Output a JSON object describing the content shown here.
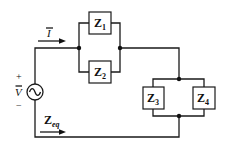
{
  "diagram": {
    "type": "circuit",
    "current_label": "I",
    "source": {
      "label": "V",
      "plus": "+",
      "minus": "−",
      "symbol": "~"
    },
    "equivalent_label": {
      "main": "Z",
      "sub": "eq"
    },
    "impedances": [
      {
        "main": "Z",
        "sub": "1"
      },
      {
        "main": "Z",
        "sub": "2"
      },
      {
        "main": "Z",
        "sub": "3"
      },
      {
        "main": "Z",
        "sub": "4"
      }
    ],
    "topology": "V source in series with (Z1 || Z2) in series with (Z3 || Z4)"
  }
}
